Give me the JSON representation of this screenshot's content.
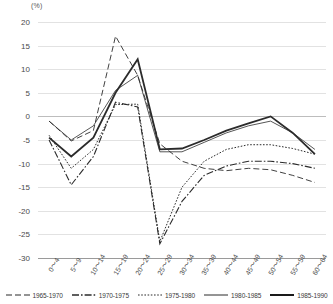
{
  "chart_data": {
    "type": "line",
    "title": "",
    "xlabel": "",
    "ylabel": "(%)",
    "unit_label": "(%)",
    "ylim": [
      -30,
      20
    ],
    "ytick_step": 5,
    "grid": true,
    "legend_position": "bottom",
    "categories": [
      "0～4",
      "5～9",
      "10～14",
      "15～19",
      "20～24",
      "25～29",
      "30～34",
      "35～39",
      "40～44",
      "45～49",
      "50～54",
      "55～59",
      "60～64"
    ],
    "yticks": [
      "20",
      "15",
      "10",
      "5",
      "0",
      "-5",
      "-10",
      "-15",
      "-20",
      "-25",
      "-30"
    ],
    "series": [
      {
        "name": "1965-1970",
        "style": "dashed",
        "color": "#2b2b2b",
        "values": [
          -1.0,
          -5.2,
          -3.0,
          17.0,
          8.7,
          -5.8,
          -9.5,
          -11.0,
          -11.5,
          -11.0,
          -11.3,
          -12.5,
          -14.0
        ]
      },
      {
        "name": "1970-1975",
        "style": "dash-dot",
        "color": "#2b2b2b",
        "values": [
          -5.0,
          -14.5,
          -8.5,
          3.0,
          2.0,
          -27.0,
          -18.0,
          -12.5,
          -10.5,
          -9.5,
          -9.5,
          -10.0,
          -11.0
        ]
      },
      {
        "name": "1975-1980",
        "style": "dotted",
        "color": "#2b2b2b",
        "values": [
          -4.0,
          -11.0,
          -7.0,
          2.5,
          2.6,
          -26.5,
          -15.0,
          -9.5,
          -7.0,
          -6.0,
          -6.0,
          -6.8,
          -8.0
        ]
      },
      {
        "name": "1980-1985",
        "style": "solid-thin",
        "color": "#2b2b2b",
        "values": [
          -1.0,
          -5.0,
          -2.0,
          5.5,
          8.7,
          -7.5,
          -7.5,
          -5.5,
          -3.5,
          -2.0,
          -1.0,
          -3.5,
          -7.0
        ]
      },
      {
        "name": "1985-1990",
        "style": "solid-thick",
        "color": "#1a1a1a",
        "values": [
          -4.5,
          -8.5,
          -4.5,
          5.0,
          12.1,
          -7.0,
          -6.8,
          -5.0,
          -3.0,
          -1.5,
          0.0,
          -3.5,
          -8.0
        ]
      }
    ]
  }
}
